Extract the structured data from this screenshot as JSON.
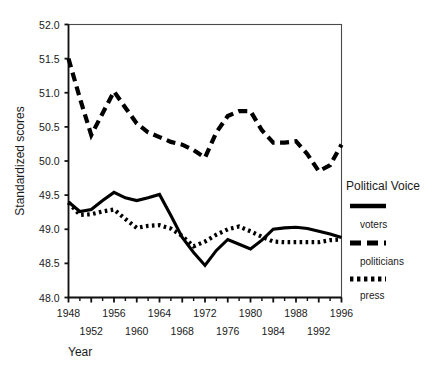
{
  "chart_data": {
    "type": "line",
    "title": "",
    "xlabel": "Year",
    "ylabel": "Standardized scores",
    "xlim": [
      1948,
      1996
    ],
    "ylim": [
      48.0,
      52.0
    ],
    "grid": false,
    "legend_position": "right",
    "legend_title": "Political Voice",
    "x_ticks": [
      1948,
      1950,
      1952,
      1954,
      1956,
      1958,
      1960,
      1962,
      1964,
      1966,
      1968,
      1970,
      1972,
      1974,
      1976,
      1978,
      1980,
      1982,
      1984,
      1986,
      1988,
      1990,
      1992,
      1994,
      1996
    ],
    "x_tick_labels_top": [
      "1948",
      "1956",
      "1964",
      "1972",
      "1980",
      "1988",
      "1996"
    ],
    "x_tick_labels_bottom": [
      "1952",
      "1960",
      "1968",
      "1976",
      "1984",
      "1992"
    ],
    "y_ticks": [
      48.0,
      48.5,
      49.0,
      49.5,
      50.0,
      50.5,
      51.0,
      51.5,
      52.0
    ],
    "y_tick_labels": [
      "48.0",
      "48.5",
      "49.0",
      "49.5",
      "50.0",
      "50.5",
      "51.0",
      "51.5",
      "52.0"
    ],
    "x": [
      1948,
      1950,
      1952,
      1954,
      1956,
      1958,
      1960,
      1962,
      1964,
      1966,
      1968,
      1970,
      1972,
      1974,
      1976,
      1978,
      1980,
      1982,
      1984,
      1986,
      1988,
      1990,
      1992,
      1994,
      1996
    ],
    "series": [
      {
        "name": "voters",
        "style": "solid",
        "color": "#000000",
        "values": [
          49.4,
          49.26,
          49.29,
          49.42,
          49.54,
          49.46,
          49.42,
          49.46,
          49.51,
          49.2,
          48.88,
          48.66,
          48.47,
          48.69,
          48.85,
          48.78,
          48.71,
          48.84,
          49.0,
          49.02,
          49.03,
          49.01,
          48.97,
          48.93,
          48.88
        ]
      },
      {
        "name": "politicians",
        "style": "dashed",
        "color": "#000000",
        "values": [
          51.5,
          50.92,
          50.38,
          50.7,
          51.02,
          50.78,
          50.55,
          50.42,
          50.35,
          50.28,
          50.24,
          50.16,
          50.05,
          50.42,
          50.66,
          50.73,
          50.73,
          50.45,
          50.27,
          50.27,
          50.29,
          50.1,
          49.85,
          49.94,
          50.24
        ]
      },
      {
        "name": "press",
        "style": "dotted",
        "color": "#000000",
        "values": [
          49.39,
          49.21,
          49.22,
          49.26,
          49.29,
          49.15,
          49.02,
          49.05,
          49.06,
          49.01,
          48.9,
          48.75,
          48.82,
          48.92,
          49.0,
          49.04,
          48.97,
          48.89,
          48.82,
          48.81,
          48.81,
          48.81,
          48.81,
          48.84,
          48.85
        ]
      }
    ]
  },
  "legend": {
    "title": "Political Voice",
    "entries": [
      {
        "label": "voters",
        "style": "solid"
      },
      {
        "label": "politicians",
        "style": "dashed"
      },
      {
        "label": "press",
        "style": "dotted"
      }
    ]
  },
  "axes": {
    "y_title": "Standardized scores",
    "x_title": "Year"
  }
}
